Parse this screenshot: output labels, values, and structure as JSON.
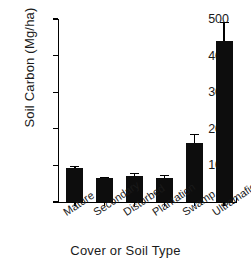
{
  "chart_data": {
    "type": "bar",
    "title": "",
    "xlabel": "Cover or Soil Type",
    "ylabel": "Soil Carbon (Mg/ha)",
    "categories": [
      "Mature",
      "Secondary",
      "Disturbed",
      "Plantation",
      "Swamp",
      "Ultramafic"
    ],
    "values": [
      93,
      65,
      72,
      66,
      161,
      440
    ],
    "errors": [
      6,
      3,
      7,
      7,
      25,
      52
    ],
    "ylim": [
      0,
      500
    ],
    "yticks": [
      0,
      100,
      200,
      300,
      400,
      500
    ],
    "ytick_labels": [
      "0",
      "100",
      "200",
      "300",
      "400",
      "500"
    ],
    "grid": false,
    "legend": false,
    "bar_color": "#0d0d0d",
    "axis_color": "#000000",
    "error_bar_style": "capped-upper"
  }
}
